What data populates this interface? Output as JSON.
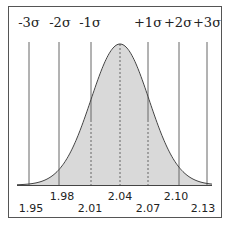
{
  "chart_data": {
    "type": "area",
    "title": "",
    "mean": 2.04,
    "std_dev": 0.03,
    "sigma_labels": [
      "-3σ",
      "-2σ",
      "-1σ",
      "+1σ",
      "+2σ",
      "+3σ"
    ],
    "sigma_values": [
      -3,
      -2,
      -1,
      1,
      2,
      3
    ],
    "x_tick_labels_upper": [
      "1.98",
      "2.04",
      "2.10"
    ],
    "x_tick_labels_lower": [
      "1.95",
      "2.01",
      "2.07",
      "2.13"
    ],
    "x_ticks": [
      1.95,
      1.98,
      2.01,
      2.04,
      2.07,
      2.1,
      2.13
    ],
    "dashed_lines_at": [
      2.01,
      2.04,
      2.07
    ],
    "solid_lines_at": [
      1.95,
      1.98,
      2.01,
      2.07,
      2.1,
      2.13
    ],
    "xlabel": "",
    "ylabel": "",
    "xlim": [
      1.93,
      2.15
    ],
    "grid": false,
    "legend": null,
    "fill_color": "#d9d9d9",
    "line_color": "#444444"
  },
  "labels": {
    "sigma_m3": "-3σ",
    "sigma_m2": "-2σ",
    "sigma_m1": "-1σ",
    "sigma_p1": "+1σ",
    "sigma_p2": "+2σ",
    "sigma_p3": "+3σ",
    "tick_195": "1.95",
    "tick_198": "1.98",
    "tick_201": "2.01",
    "tick_204": "2.04",
    "tick_207": "2.07",
    "tick_210": "2.10",
    "tick_213": "2.13"
  }
}
